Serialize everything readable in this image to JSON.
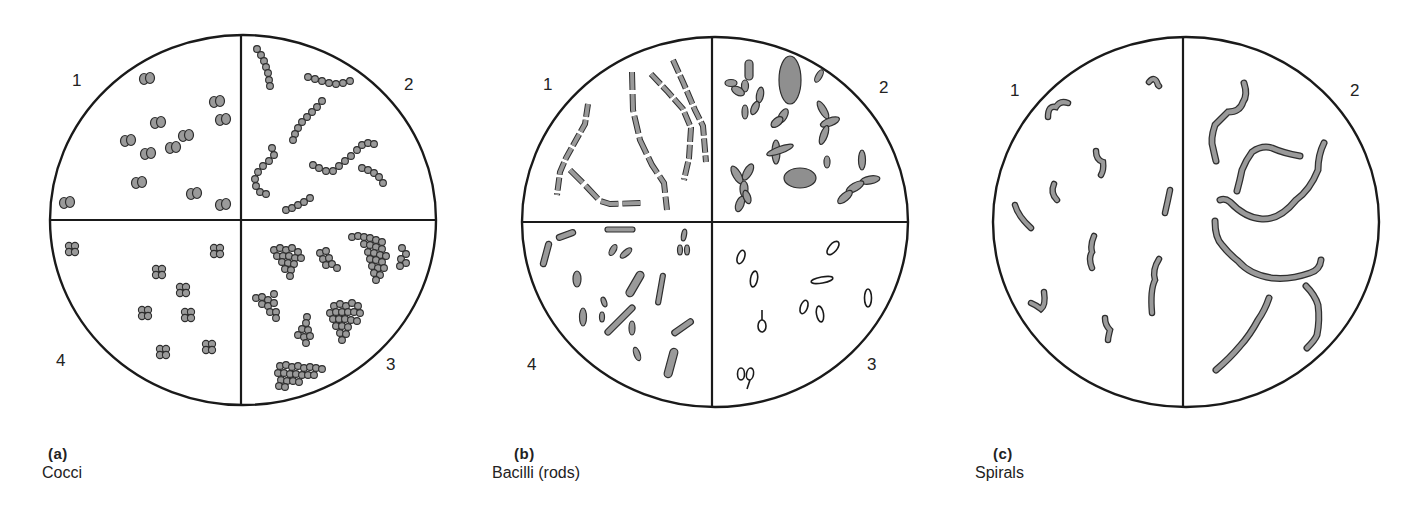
{
  "figure": {
    "style": {
      "outline": "#1a1a1a",
      "cell_fill": "#9a9a9a",
      "cell_stroke": "#2e2e2e",
      "background": "#ffffff"
    },
    "panels": [
      {
        "id": "a",
        "letter": "(a)",
        "name": "Cocci",
        "circle": {
          "cx": 243,
          "cy": 220,
          "rx": 193,
          "ry": 185
        },
        "dividers": "cross",
        "quadrant_labels": [
          {
            "text": "1",
            "x": 72,
            "y": 86
          },
          {
            "text": "2",
            "x": 404,
            "y": 90
          },
          {
            "text": "3",
            "x": 386,
            "y": 370
          },
          {
            "text": "4",
            "x": 56,
            "y": 366
          }
        ],
        "caption_pos": {
          "left": 42,
          "top": 445
        }
      },
      {
        "id": "b",
        "letter": "(b)",
        "name": "Bacilli (rods)",
        "circle": {
          "cx": 715,
          "cy": 222,
          "rx": 193,
          "ry": 185
        },
        "dividers": "cross",
        "quadrant_labels": [
          {
            "text": "1",
            "x": 543,
            "y": 90
          },
          {
            "text": "2",
            "x": 879,
            "y": 93
          },
          {
            "text": "3",
            "x": 867,
            "y": 370
          },
          {
            "text": "4",
            "x": 527,
            "y": 370
          }
        ],
        "caption_pos": {
          "left": 492,
          "top": 445
        }
      },
      {
        "id": "c",
        "letter": "(c)",
        "name": "Spirals",
        "circle": {
          "cx": 1186,
          "cy": 222,
          "rx": 193,
          "ry": 185
        },
        "dividers": "vertical",
        "quadrant_labels": [
          {
            "text": "1",
            "x": 1010,
            "y": 96
          },
          {
            "text": "2",
            "x": 1350,
            "y": 96
          }
        ],
        "caption_pos": {
          "left": 975,
          "top": 445
        }
      }
    ]
  }
}
